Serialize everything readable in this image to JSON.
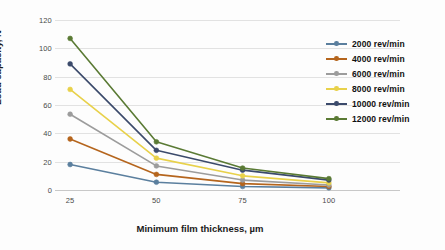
{
  "chart_data": {
    "type": "line",
    "title": "",
    "xlabel": "Minimum film thickness, µm",
    "ylabel": "Load capacity, N",
    "x": [
      25,
      50,
      75,
      100
    ],
    "xtick_labels": [
      "25",
      "50",
      "75",
      "100"
    ],
    "ytick_labels": [
      "0",
      "20",
      "40",
      "60",
      "80",
      "100",
      "120"
    ],
    "yticks": [
      0,
      20,
      40,
      60,
      80,
      100,
      120
    ],
    "ylim": [
      0,
      120
    ],
    "grid": "horizontal",
    "legend_position": "right",
    "markers": "circle",
    "series": [
      {
        "name": "2000 rev/min",
        "color": "#5b7f9e",
        "values": [
          18,
          5.5,
          2.5,
          1.5
        ]
      },
      {
        "name": "4000 rev/min",
        "color": "#b5651d",
        "values": [
          36,
          11,
          4.5,
          2.5
        ]
      },
      {
        "name": "6000 rev/min",
        "color": "#9c9c9c",
        "values": [
          53.5,
          17,
          7,
          3.5
        ]
      },
      {
        "name": "8000 rev/min",
        "color": "#e8d14a",
        "values": [
          71,
          22.5,
          10,
          5
        ]
      },
      {
        "name": "10000 rev/min",
        "color": "#3b4a6b",
        "values": [
          89,
          28,
          14,
          7
        ]
      },
      {
        "name": "12000 rev/min",
        "color": "#5a7a34",
        "values": [
          107,
          34,
          15.5,
          8
        ]
      }
    ]
  },
  "legend": {
    "items": [
      {
        "label": "2000 rev/min"
      },
      {
        "label": "4000 rev/min"
      },
      {
        "label": "6000 rev/min"
      },
      {
        "label": "8000 rev/min"
      },
      {
        "label": "10000 rev/min"
      },
      {
        "label": "12000 rev/min"
      }
    ]
  }
}
